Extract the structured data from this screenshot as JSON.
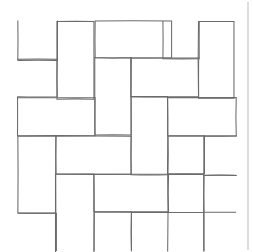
{
  "figure": {
    "kind": "line-drawing",
    "caption": "",
    "width": 253,
    "height": 252,
    "background_color": "#ffffff",
    "stroke_color": "#6b6b6b",
    "stroke_width": 1.05,
    "margin_rule_color": "#b9b9b9"
  },
  "pattern": {
    "name": "basketweave",
    "module_size": 40,
    "brick_long_side": 80,
    "brick_short_side": 40,
    "grid_origin_x": 18,
    "grid_origin_y": 21,
    "rows": 5,
    "columns": 5,
    "orientation_note": "alternating horizontal and vertical bricks, pinwheel offset per module",
    "hand_drawn": true
  },
  "bricks": [
    {
      "id": "b01",
      "x": 18,
      "y": 21,
      "w": 39,
      "h": 39,
      "orient": "horizontal",
      "clip": "top"
    },
    {
      "id": "b02",
      "x": 57,
      "y": 21,
      "w": 37,
      "h": 78,
      "orient": "vertical",
      "clip": "none"
    },
    {
      "id": "b03",
      "x": 95,
      "y": 21,
      "w": 77,
      "h": 37,
      "orient": "horizontal",
      "clip": "none"
    },
    {
      "id": "b04",
      "x": 163,
      "y": 21,
      "w": 36,
      "h": 38,
      "orient": "horizontal",
      "clip": "top"
    },
    {
      "id": "b05",
      "x": 198,
      "y": 21,
      "w": 36,
      "h": 77,
      "orient": "vertical",
      "clip": "none"
    },
    {
      "id": "b06",
      "x": 18,
      "y": 59,
      "w": 39,
      "h": 38,
      "orient": "horizontal",
      "clip": "left"
    },
    {
      "id": "b07",
      "x": 95,
      "y": 58,
      "w": 36,
      "h": 77,
      "orient": "vertical",
      "clip": "none"
    },
    {
      "id": "b08",
      "x": 131,
      "y": 58,
      "w": 68,
      "h": 39,
      "orient": "horizontal",
      "clip": "none"
    },
    {
      "id": "b09",
      "x": 18,
      "y": 98,
      "w": 77,
      "h": 38,
      "orient": "horizontal",
      "clip": "none"
    },
    {
      "id": "b10",
      "x": 131,
      "y": 97,
      "w": 37,
      "h": 78,
      "orient": "vertical",
      "clip": "none"
    },
    {
      "id": "b11",
      "x": 168,
      "y": 98,
      "w": 68,
      "h": 38,
      "orient": "horizontal",
      "clip": "none"
    },
    {
      "id": "b12",
      "x": 18,
      "y": 136,
      "w": 38,
      "h": 77,
      "orient": "vertical",
      "clip": "none"
    },
    {
      "id": "b13",
      "x": 56,
      "y": 136,
      "w": 75,
      "h": 38,
      "orient": "horizontal",
      "clip": "none"
    },
    {
      "id": "b14",
      "x": 168,
      "y": 136,
      "w": 36,
      "h": 38,
      "orient": "horizontal",
      "clip": "none"
    },
    {
      "id": "b15",
      "x": 204,
      "y": 136,
      "w": 32,
      "h": 39,
      "orient": "horizontal",
      "clip": "right"
    },
    {
      "id": "b16",
      "x": 56,
      "y": 174,
      "w": 38,
      "h": 78,
      "orient": "vertical",
      "clip": "bottom"
    },
    {
      "id": "b17",
      "x": 94,
      "y": 174,
      "w": 74,
      "h": 38,
      "orient": "horizontal",
      "clip": "none"
    },
    {
      "id": "b18",
      "x": 168,
      "y": 174,
      "w": 36,
      "h": 77,
      "orient": "vertical",
      "clip": "bottom"
    },
    {
      "id": "b19",
      "x": 204,
      "y": 175,
      "w": 32,
      "h": 37,
      "orient": "horizontal",
      "clip": "right"
    },
    {
      "id": "b20",
      "x": 18,
      "y": 213,
      "w": 38,
      "h": 38,
      "orient": "horizontal",
      "clip": "left-bottom"
    },
    {
      "id": "b21",
      "x": 94,
      "y": 212,
      "w": 37,
      "h": 39,
      "orient": "horizontal",
      "clip": "bottom"
    },
    {
      "id": "b22",
      "x": 131,
      "y": 212,
      "w": 73,
      "h": 39,
      "orient": "horizontal",
      "clip": "bottom"
    }
  ],
  "edges": {
    "right_margin_rule": {
      "x": 248,
      "y1": 2,
      "y2": 250,
      "color": "#b9b9b9"
    }
  }
}
